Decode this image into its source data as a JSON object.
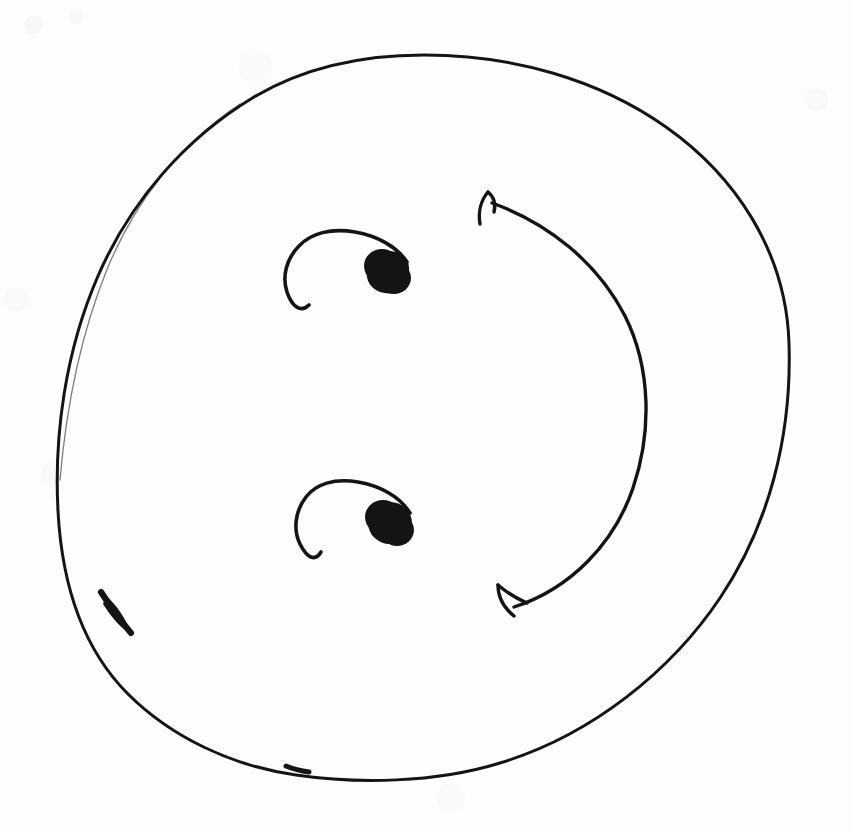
{
  "figure": {
    "medium": "ink on paper (scanned)",
    "background_color": "#fdfdfd",
    "ink_color": "#141414",
    "canvas": {
      "width": 851,
      "height": 831
    },
    "caption": ""
  },
  "elements": {
    "outer_circle": {
      "name": "disk-boundary",
      "shape": "circle",
      "center_x": 424,
      "center_y": 416,
      "radius_x": 366,
      "radius_y": 361,
      "stroke_width": 3.2,
      "notes": "slightly irregular freehand circle; thickened ink blob on lower-left edge and a small blot near lower-centre"
    },
    "upper_vortex": {
      "name": "upper-vortex-spiral",
      "shape": "open hook curve terminating in filled dot",
      "dot_center_x": 388,
      "dot_center_y": 272,
      "dot_radius": 21,
      "curve_start_x": 404,
      "curve_start_y": 258,
      "curve_end_x": 310,
      "curve_end_y": 304,
      "stroke_width": 3.4,
      "direction": "counter-clockwise inward"
    },
    "lower_vortex": {
      "name": "lower-vortex-spiral",
      "shape": "open hook curve terminating in filled dot",
      "dot_center_x": 390,
      "dot_center_y": 523,
      "dot_radius": 21,
      "curve_start_x": 406,
      "curve_start_y": 509,
      "curve_end_x": 318,
      "curve_end_y": 553,
      "stroke_width": 3.4,
      "direction": "counter-clockwise inward"
    },
    "rotation_arrow": {
      "name": "rotation-arc-arrow",
      "shape": "bowed arc with arrowheads at both ends",
      "start_x": 487,
      "start_y": 194,
      "end_x": 500,
      "end_y": 612,
      "bulge_x": 641,
      "bulge_y": 402,
      "stroke_width": 3.4,
      "head_count": 2,
      "head_top_direction": "up-left",
      "head_bottom_direction": "down-left",
      "meaning": "bidirectional rotation about the disk centre"
    }
  },
  "chart_data": {
    "type": "diagram",
    "annotations": [
      "outer freehand circle = disk / body boundary",
      "two filled dots with inward hook curves = vortex cores",
      "double-headed arc on the right = sense of rotation"
    ]
  }
}
